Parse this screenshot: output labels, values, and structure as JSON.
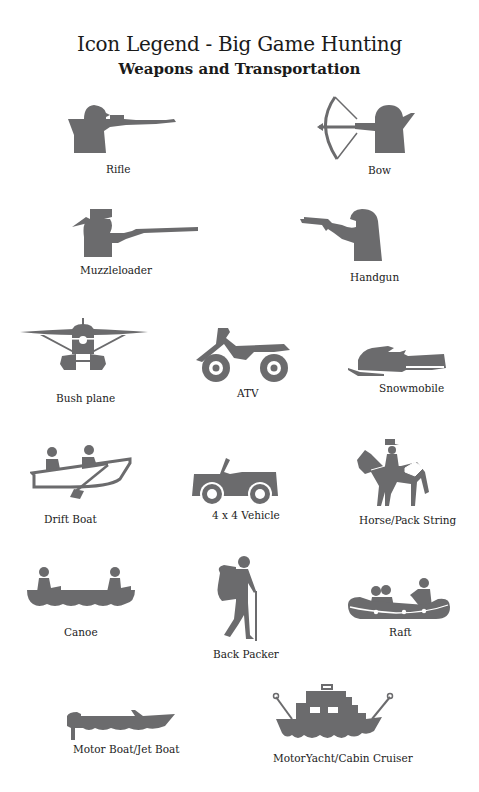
{
  "header": {
    "title": "Icon Legend - Big Game Hunting",
    "subtitle": "Weapons and Transportation"
  },
  "colors": {
    "icon_fill": "#6b6b6d",
    "text": "#222222",
    "background": "#ffffff"
  },
  "legend": {
    "weapons": [
      {
        "icon": "rifle-icon",
        "label": "Rifle"
      },
      {
        "icon": "bow-icon",
        "label": "Bow"
      },
      {
        "icon": "muzzleloader-icon",
        "label": "Muzzleloader"
      },
      {
        "icon": "handgun-icon",
        "label": "Handgun"
      }
    ],
    "transportation": [
      {
        "icon": "bush-plane-icon",
        "label": "Bush plane"
      },
      {
        "icon": "atv-icon",
        "label": "ATV"
      },
      {
        "icon": "snowmobile-icon",
        "label": "Snowmobile"
      },
      {
        "icon": "drift-boat-icon",
        "label": "Drift Boat"
      },
      {
        "icon": "4x4-vehicle-icon",
        "label": "4 x 4 Vehicle"
      },
      {
        "icon": "horse-pack-string-icon",
        "label": "Horse/Pack String"
      },
      {
        "icon": "canoe-icon",
        "label": "Canoe"
      },
      {
        "icon": "back-packer-icon",
        "label": "Back Packer"
      },
      {
        "icon": "raft-icon",
        "label": "Raft"
      },
      {
        "icon": "motor-boat-jet-boat-icon",
        "label": "Motor Boat/Jet Boat"
      },
      {
        "icon": "motor-yacht-cabin-cruiser-icon",
        "label": "MotorYacht/Cabin Cruiser"
      }
    ]
  }
}
